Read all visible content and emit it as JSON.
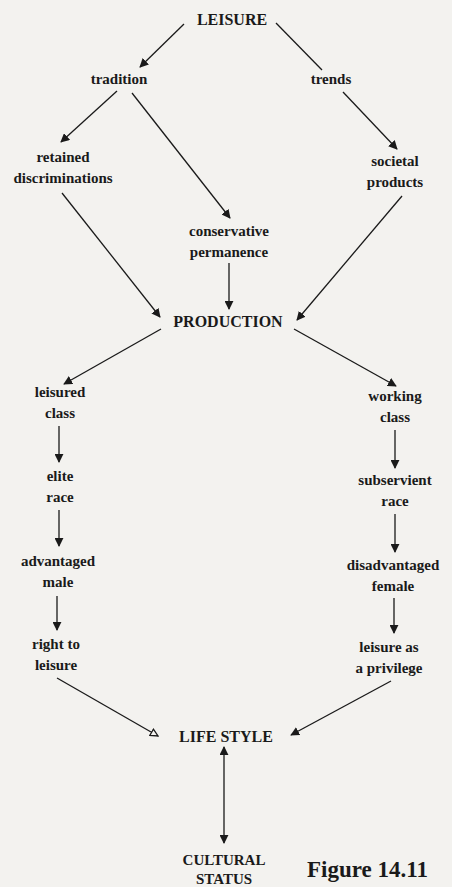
{
  "figure": {
    "caption": "Figure 14.11"
  },
  "nodes": {
    "leisure": {
      "lines": [
        "LEISURE"
      ]
    },
    "tradition": {
      "lines": [
        "tradition"
      ]
    },
    "trends": {
      "lines": [
        "trends"
      ]
    },
    "retained_discriminations": {
      "lines": [
        "retained",
        "discriminations"
      ]
    },
    "societal_products": {
      "lines": [
        "societal",
        "products"
      ]
    },
    "conservative_permanence": {
      "lines": [
        "conservative",
        "permanence"
      ]
    },
    "production": {
      "lines": [
        "PRODUCTION"
      ]
    },
    "leisured_class": {
      "lines": [
        "leisured",
        "class"
      ]
    },
    "working_class": {
      "lines": [
        "working",
        "class"
      ]
    },
    "elite_race": {
      "lines": [
        "elite",
        "race"
      ]
    },
    "subservient_race": {
      "lines": [
        "subservient",
        "race"
      ]
    },
    "advantaged_male": {
      "lines": [
        "advantaged",
        "male"
      ]
    },
    "disadvantaged_female": {
      "lines": [
        "disadvantaged",
        "female"
      ]
    },
    "right_to_leisure": {
      "lines": [
        "right to",
        "leisure"
      ]
    },
    "leisure_privilege": {
      "lines": [
        "leisure as",
        "a privilege"
      ]
    },
    "life_style": {
      "lines": [
        "LIFE STYLE"
      ]
    },
    "cultural_status": {
      "lines": [
        "CULTURAL",
        "STATUS"
      ]
    }
  },
  "edges": [
    {
      "from": "LEISURE",
      "to": "tradition",
      "arrow": "filled"
    },
    {
      "from": "LEISURE",
      "to": "trends",
      "arrow": "none"
    },
    {
      "from": "tradition",
      "to": "retained discriminations",
      "arrow": "filled"
    },
    {
      "from": "tradition",
      "to": "conservative permanence",
      "arrow": "filled"
    },
    {
      "from": "trends",
      "to": "societal products",
      "arrow": "filled"
    },
    {
      "from": "retained discriminations",
      "to": "PRODUCTION",
      "arrow": "filled"
    },
    {
      "from": "conservative permanence",
      "to": "PRODUCTION",
      "arrow": "filled"
    },
    {
      "from": "societal products",
      "to": "PRODUCTION",
      "arrow": "filled"
    },
    {
      "from": "PRODUCTION",
      "to": "leisured class",
      "arrow": "filled"
    },
    {
      "from": "PRODUCTION",
      "to": "working class",
      "arrow": "filled"
    },
    {
      "from": "leisured class",
      "to": "elite race",
      "arrow": "filled"
    },
    {
      "from": "elite race",
      "to": "advantaged male",
      "arrow": "filled"
    },
    {
      "from": "advantaged male",
      "to": "right to leisure",
      "arrow": "filled"
    },
    {
      "from": "working class",
      "to": "subservient race",
      "arrow": "filled"
    },
    {
      "from": "subservient race",
      "to": "disadvantaged female",
      "arrow": "filled"
    },
    {
      "from": "disadvantaged female",
      "to": "leisure as a privilege",
      "arrow": "filled"
    },
    {
      "from": "right to leisure",
      "to": "LIFE STYLE",
      "arrow": "hollow"
    },
    {
      "from": "leisure as a privilege",
      "to": "LIFE STYLE",
      "arrow": "filled"
    },
    {
      "from": "LIFE STYLE",
      "to": "CULTURAL STATUS",
      "arrow": "bidirectional"
    }
  ],
  "colors": {
    "background": "#f3f2ef",
    "ink": "#1a1a1a"
  }
}
